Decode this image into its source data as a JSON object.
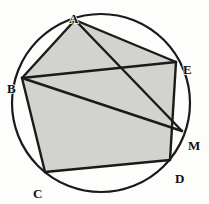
{
  "figure": {
    "background_color": "#fdfdfc",
    "stroke_color": "#1a1a1a",
    "fill_color": "#d2d2ce",
    "circle": {
      "name": "circumscribed-circle",
      "cx": 101,
      "cy": 103,
      "r": 89,
      "stroke_width": 2.2
    },
    "points": [
      {
        "id": "A",
        "label": "A",
        "x": 75,
        "y": 20,
        "label_x": 69,
        "label_y": 13,
        "on_circle": true
      },
      {
        "id": "B",
        "label": "B",
        "x": 22,
        "y": 78,
        "label_x": 7,
        "label_y": 83,
        "on_circle": true
      },
      {
        "id": "C",
        "label": "C",
        "x": 45,
        "y": 172,
        "label_x": 33,
        "label_y": 188,
        "on_circle": true
      },
      {
        "id": "D",
        "label": "D",
        "x": 170,
        "y": 160,
        "label_x": 175,
        "label_y": 173,
        "on_circle": true
      },
      {
        "id": "E",
        "label": "E",
        "x": 176,
        "y": 62,
        "label_x": 183,
        "label_y": 64,
        "on_circle": true
      },
      {
        "id": "M",
        "label": "M",
        "x": 182,
        "y": 131,
        "label_x": 188,
        "label_y": 140,
        "on_circle": false
      }
    ],
    "polygon": {
      "name": "shaded-pentagon-abcde",
      "vertex_ids": [
        "A",
        "B",
        "C",
        "D",
        "E"
      ],
      "points": "75,20 22,78 45,172 170,160 176,62",
      "fill": "#d2d2ce",
      "stroke_width": 2.2
    },
    "segments": [
      {
        "name": "segment-ab",
        "from": "A",
        "to": "B",
        "x1": 75,
        "y1": 20,
        "x2": 22,
        "y2": 78,
        "width": 2.4
      },
      {
        "name": "segment-bc",
        "from": "B",
        "to": "C",
        "x1": 22,
        "y1": 78,
        "x2": 45,
        "y2": 172,
        "width": 2.4
      },
      {
        "name": "segment-cd",
        "from": "C",
        "to": "D",
        "x1": 45,
        "y1": 172,
        "x2": 170,
        "y2": 160,
        "width": 2.4
      },
      {
        "name": "segment-de",
        "from": "D",
        "to": "E",
        "x1": 170,
        "y1": 160,
        "x2": 176,
        "y2": 62,
        "width": 2.4
      },
      {
        "name": "segment-ea",
        "from": "E",
        "to": "A",
        "x1": 176,
        "y1": 62,
        "x2": 75,
        "y2": 20,
        "width": 2.4
      },
      {
        "name": "diagonal-be",
        "from": "B",
        "to": "E",
        "x1": 22,
        "y1": 78,
        "x2": 176,
        "y2": 62,
        "width": 2.4
      },
      {
        "name": "diagonal-am",
        "from": "A",
        "to": "M",
        "x1": 75,
        "y1": 20,
        "x2": 182,
        "y2": 131,
        "width": 2.4
      },
      {
        "name": "diagonal-bm",
        "from": "B",
        "to": "M",
        "x1": 22,
        "y1": 78,
        "x2": 182,
        "y2": 131,
        "width": 2.4
      }
    ]
  }
}
